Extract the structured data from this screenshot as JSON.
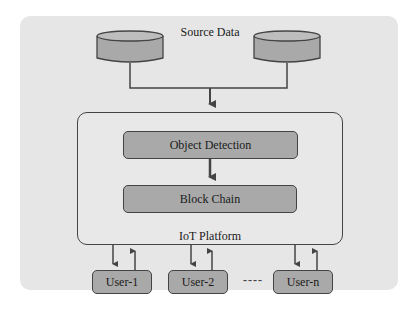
{
  "diagram": {
    "source_label": "Source Data",
    "platform_label": "IoT Platform",
    "modules": [
      {
        "label": "Object Detection"
      },
      {
        "label": "Block Chain"
      }
    ],
    "users": [
      {
        "label": "User-1"
      },
      {
        "label": "User-2"
      },
      {
        "label": "User-n"
      }
    ],
    "ellipsis": "----",
    "colors": {
      "panel": "#e6e6e6",
      "box_fill": "#a9a9a9",
      "stroke": "#444444"
    }
  }
}
